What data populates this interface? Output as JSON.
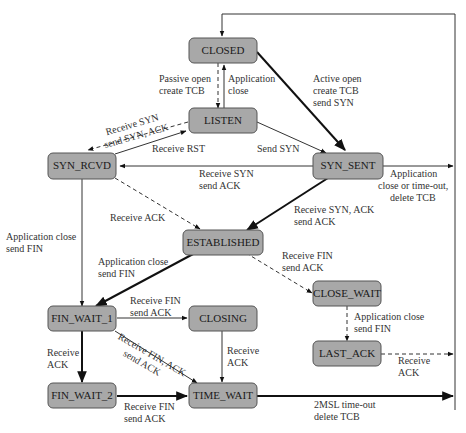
{
  "diagram": {
    "states": [
      {
        "id": "closed",
        "label": "CLOSED"
      },
      {
        "id": "listen",
        "label": "LISTEN"
      },
      {
        "id": "syn_rcvd",
        "label": "SYN_RCVD"
      },
      {
        "id": "syn_sent",
        "label": "SYN_SENT"
      },
      {
        "id": "established",
        "label": "ESTABLISHED"
      },
      {
        "id": "close_wait",
        "label": "CLOSE_WAIT"
      },
      {
        "id": "last_ack",
        "label": "LAST_ACK"
      },
      {
        "id": "fin_wait_1",
        "label": "FIN_WAIT_1"
      },
      {
        "id": "closing",
        "label": "CLOSING"
      },
      {
        "id": "fin_wait_2",
        "label": "FIN_WAIT_2"
      },
      {
        "id": "time_wait",
        "label": "TIME_WAIT"
      }
    ],
    "labels": {
      "passive_open": [
        "Passive open",
        "create TCB"
      ],
      "app_close_listen": [
        "Application",
        "close"
      ],
      "active_open": [
        "Active open",
        "create TCB",
        "send SYN"
      ],
      "rcv_syn_listen": [
        "Receive SYN",
        "send SYN, ACK"
      ],
      "rcv_rst": [
        "Receive RST"
      ],
      "send_syn": [
        "Send SYN"
      ],
      "rcv_syn_synsent": [
        "Receive SYN",
        "send ACK"
      ],
      "app_close_synsent": [
        "Application",
        "close or time-out,",
        "delete TCB"
      ],
      "rcv_ack_synrcvd": [
        "Receive ACK"
      ],
      "rcv_synack": [
        "Receive SYN, ACK",
        "send ACK"
      ],
      "app_close_synrcvd": [
        "Application close",
        "send FIN"
      ],
      "app_close_est": [
        "Application close",
        "send FIN"
      ],
      "rcv_fin_est": [
        "Receive FIN",
        "send ACK"
      ],
      "rcv_fin_fw1": [
        "Receive FIN",
        "send ACK"
      ],
      "app_close_cw": [
        "Application close",
        "send FIN"
      ],
      "rcv_ack_fw1": [
        "Receive",
        "ACK"
      ],
      "rcv_finack_fw1": [
        "Receive FIN, ACK",
        "send ACK"
      ],
      "rcv_ack_closing": [
        "Receive",
        "ACK"
      ],
      "rcv_ack_lastack": [
        "Receive",
        "ACK"
      ],
      "rcv_fin_fw2": [
        "Receive FIN",
        "send ACK"
      ],
      "timeout_2msl": [
        "2MSL time-out",
        "delete TCB"
      ]
    }
  }
}
